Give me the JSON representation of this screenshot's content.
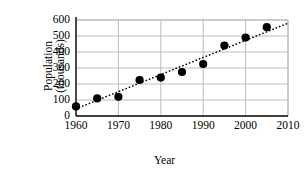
{
  "chart_data": {
    "type": "scatter",
    "title": "",
    "xlabel": "Year",
    "ylabel": "Population (thousands)",
    "ylabel_lines": [
      "Population",
      "(thousands)"
    ],
    "x": [
      1960,
      1965,
      1970,
      1975,
      1980,
      1985,
      1990,
      1995,
      2000,
      2005
    ],
    "values": [
      60,
      110,
      120,
      225,
      240,
      275,
      325,
      440,
      490,
      555
    ],
    "series": [
      {
        "name": "Population",
        "x": [
          1960,
          1965,
          1970,
          1975,
          1980,
          1985,
          1990,
          1995,
          2000,
          2005
        ],
        "values": [
          60,
          110,
          120,
          225,
          240,
          275,
          325,
          440,
          490,
          555
        ],
        "marker": "filled-circle",
        "color": "#000000"
      },
      {
        "name": "trend-line",
        "type": "line",
        "style": "dotted",
        "color": "#000000",
        "x": [
          1960,
          2010
        ],
        "values": [
          45,
          580
        ]
      }
    ],
    "xlim": [
      1960,
      2010
    ],
    "ylim": [
      0,
      600
    ],
    "xticks": [
      1960,
      1970,
      1980,
      1990,
      2000,
      2010
    ],
    "xtick_labels": [
      "1960",
      "1970",
      "1980",
      "1990",
      "2000",
      "2010"
    ],
    "yticks": [
      0,
      100,
      200,
      300,
      400,
      500,
      600
    ],
    "ytick_labels": [
      "0",
      "100",
      "200",
      "300",
      "400",
      "500",
      "600"
    ],
    "grid": "both",
    "gridline_color": "#b5b5b5",
    "axis_color": "#000000",
    "legend": "none",
    "background": "#ffffff"
  }
}
